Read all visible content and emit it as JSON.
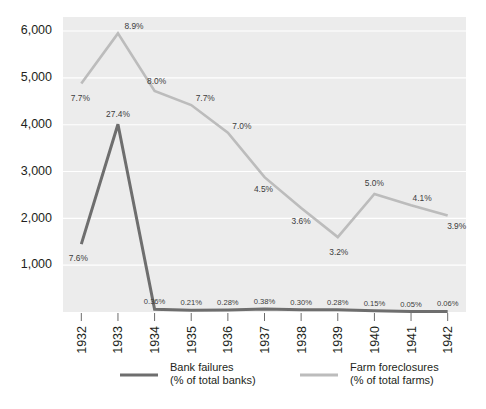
{
  "chart_data": {
    "type": "line",
    "title": "",
    "subtitle": "",
    "xlabel": "",
    "ylabel": "",
    "grid": "horizontal",
    "legend_position": "bottom",
    "x": [
      "1932",
      "1933",
      "1934",
      "1935",
      "1936",
      "1937",
      "1938",
      "1939",
      "1940",
      "1941",
      "1942"
    ],
    "ylim": [
      0,
      6300
    ],
    "yticks": [
      1000,
      2000,
      3000,
      4000,
      5000,
      6000
    ],
    "ytick_labels": [
      "1,000",
      "2,000",
      "3,000",
      "4,000",
      "5,000",
      "6,000"
    ],
    "series": [
      {
        "name": "Bank failures",
        "sublabel": "(% of total banks)",
        "color": "#6e6e6e",
        "unit": "%",
        "values": [
          1450,
          4010,
          60,
          35,
          45,
          62,
          50,
          46,
          25,
          10,
          12
        ],
        "labels": [
          "7.6%",
          "27.4%",
          "0.36%",
          "0.21%",
          "0.28%",
          "0.38%",
          "0.30%",
          "0.28%",
          "0.15%",
          "0.05%",
          "0.06%"
        ],
        "percent_values": [
          7.6,
          27.4,
          0.36,
          0.21,
          0.28,
          0.38,
          0.3,
          0.28,
          0.15,
          0.05,
          0.06
        ]
      },
      {
        "name": "Farm foreclosures",
        "sublabel": "(% of total farms)",
        "color": "#bcbcbc",
        "unit": "%",
        "values": [
          4880,
          5950,
          4720,
          4420,
          3830,
          2880,
          2220,
          1600,
          2520,
          2280,
          2060
        ],
        "labels": [
          "7.7%",
          "8.9%",
          "8.0%",
          "7.7%",
          "7.0%",
          "4.5%",
          "3.6%",
          "3.2%",
          "5.0%",
          "4.1%",
          "3.9%"
        ],
        "percent_values": [
          7.7,
          8.9,
          8.0,
          7.7,
          7.0,
          4.5,
          3.6,
          3.2,
          5.0,
          4.1,
          3.9
        ]
      }
    ]
  },
  "legend": {
    "items": [
      {
        "name": "Bank failures",
        "sublabel": "(% of total banks)",
        "color": "#6e6e6e"
      },
      {
        "name": "Farm foreclosures",
        "sublabel": "(% of total farms)",
        "color": "#bcbcbc"
      }
    ]
  }
}
